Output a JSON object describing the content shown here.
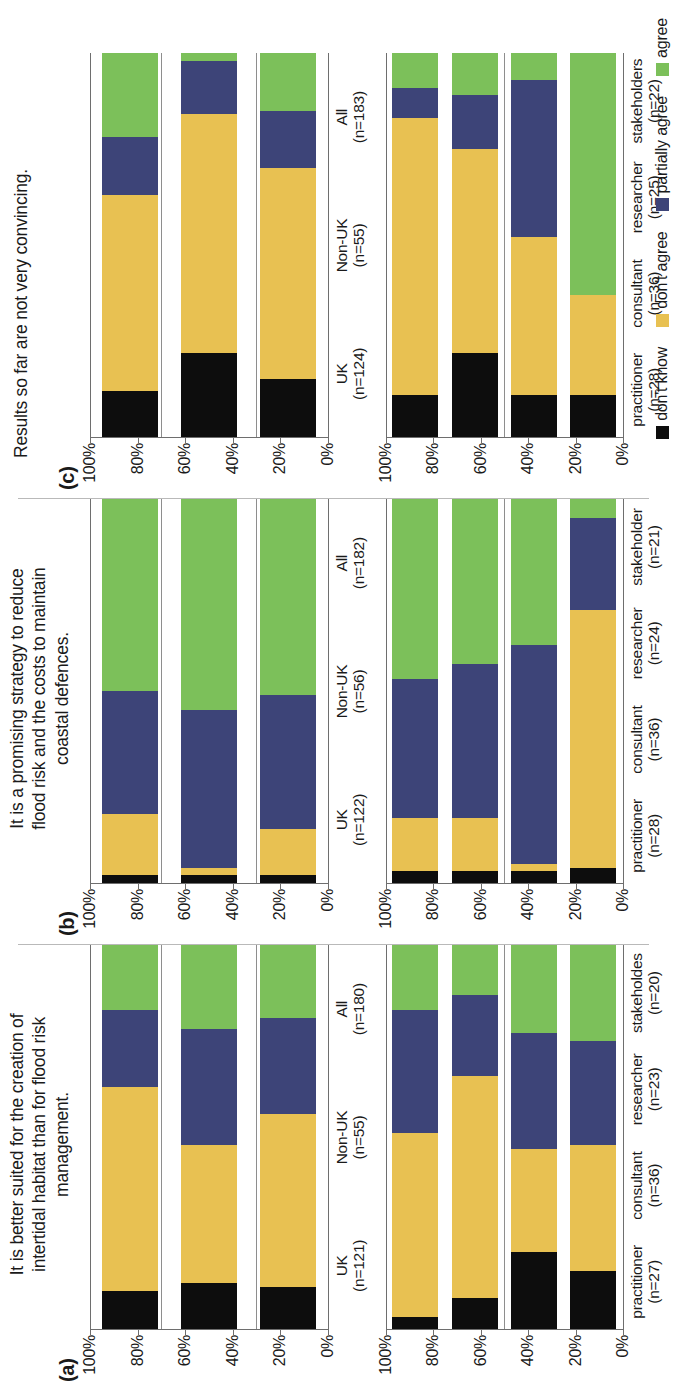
{
  "figure": {
    "legend": {
      "position": "bottom-right",
      "items": [
        {
          "label": "don't know",
          "color": "#0d0d0d"
        },
        {
          "label": "don't agree",
          "color": "#e8c152"
        },
        {
          "label": "partially agree",
          "color": "#3d4478"
        },
        {
          "label": "agree",
          "color": "#7cc05a"
        }
      ]
    },
    "axis": {
      "ticks": [
        "100%",
        "80%",
        "60%",
        "40%",
        "20%",
        "0%"
      ],
      "tick_values": [
        100,
        80,
        60,
        40,
        20,
        0
      ],
      "minor_step": 10
    },
    "panels": [
      {
        "letter": "(a)",
        "title": "It is better suited for the creation of intertidal habitat than for flood risk management.",
        "title_lines": [
          "It is better suited for the creation of",
          "intertidal habitat than for flood risk",
          "management."
        ]
      },
      {
        "letter": "(b)",
        "title": "It is a promising strategy to reduce flood risk and the costs to maintain coastal defences.",
        "title_lines": [
          "It is a promising strategy to reduce",
          "flood risk and the costs to maintain",
          "coastal defences."
        ]
      },
      {
        "letter": "(c)",
        "title": "Results so far are not very convincing.",
        "title_lines": [
          "Results so far are not very convincing."
        ]
      }
    ]
  },
  "chart_data": [
    {
      "panel": "(a)",
      "subplot": "top",
      "type": "bar",
      "orientation": "stacked-horizontal-percent",
      "title": "It is better suited for the creation of intertidal habitat than for flood risk management.",
      "xlabel": "",
      "ylabel": "",
      "ylim": [
        0,
        100
      ],
      "grid": true,
      "tick_labels": [
        "100%",
        "80%",
        "60%",
        "40%",
        "20%",
        "0%"
      ],
      "categories": [
        "UK",
        "Non-UK",
        "All"
      ],
      "category_n": [
        "(n=121)",
        "(n=55)",
        "(n=180)"
      ],
      "series": [
        {
          "name": "don't know",
          "color": "#0d0d0d",
          "values": [
            10,
            12,
            11
          ]
        },
        {
          "name": "don't agree",
          "color": "#e8c152",
          "values": [
            53,
            36,
            45
          ]
        },
        {
          "name": "partially agree",
          "color": "#3d4478",
          "values": [
            20,
            30,
            25
          ]
        },
        {
          "name": "agree",
          "color": "#7cc05a",
          "values": [
            17,
            22,
            19
          ]
        }
      ]
    },
    {
      "panel": "(a)",
      "subplot": "bottom",
      "type": "bar",
      "orientation": "stacked-horizontal-percent",
      "ylim": [
        0,
        100
      ],
      "grid": true,
      "tick_labels": [
        "100%",
        "80%",
        "60%",
        "40%",
        "20%",
        "0%"
      ],
      "categories": [
        "practitioner",
        "consultant",
        "researcher",
        "stakeholdes"
      ],
      "category_n": [
        "(n=27)",
        "(n=36)",
        "(n=23)",
        "(n=20)"
      ],
      "series": [
        {
          "name": "don't know",
          "color": "#0d0d0d",
          "values": [
            3,
            8,
            20,
            15
          ]
        },
        {
          "name": "don't agree",
          "color": "#e8c152",
          "values": [
            48,
            58,
            27,
            33
          ]
        },
        {
          "name": "partially agree",
          "color": "#3d4478",
          "values": [
            32,
            21,
            30,
            27
          ]
        },
        {
          "name": "agree",
          "color": "#7cc05a",
          "values": [
            17,
            13,
            23,
            25
          ]
        }
      ]
    },
    {
      "panel": "(b)",
      "subplot": "top",
      "type": "bar",
      "orientation": "stacked-horizontal-percent",
      "title": "It is a promising strategy to reduce flood risk and the costs to maintain coastal defences.",
      "ylim": [
        0,
        100
      ],
      "grid": true,
      "tick_labels": [
        "100%",
        "80%",
        "60%",
        "40%",
        "20%",
        "0%"
      ],
      "categories": [
        "UK",
        "Non-UK",
        "All"
      ],
      "category_n": [
        "(n=122)",
        "(n=56)",
        "(n=182)"
      ],
      "series": [
        {
          "name": "don't know",
          "color": "#0d0d0d",
          "values": [
            2,
            2,
            2
          ]
        },
        {
          "name": "don't agree",
          "color": "#e8c152",
          "values": [
            16,
            2,
            12
          ]
        },
        {
          "name": "partially agree",
          "color": "#3d4478",
          "values": [
            32,
            41,
            35
          ]
        },
        {
          "name": "agree",
          "color": "#7cc05a",
          "values": [
            50,
            55,
            51
          ]
        }
      ]
    },
    {
      "panel": "(b)",
      "subplot": "bottom",
      "type": "bar",
      "orientation": "stacked-horizontal-percent",
      "ylim": [
        0,
        100
      ],
      "grid": true,
      "tick_labels": [
        "100%",
        "80%",
        "60%",
        "40%",
        "20%",
        "0%"
      ],
      "categories": [
        "practitioner",
        "consultant",
        "researcher",
        "stakeholder"
      ],
      "category_n": [
        "(n=28)",
        "(n=36)",
        "(n=24)",
        "(n=21)"
      ],
      "series": [
        {
          "name": "don't know",
          "color": "#0d0d0d",
          "values": [
            3,
            3,
            3,
            4
          ]
        },
        {
          "name": "don't agree",
          "color": "#e8c152",
          "values": [
            14,
            14,
            2,
            67
          ]
        },
        {
          "name": "partially agree",
          "color": "#3d4478",
          "values": [
            36,
            40,
            57,
            24
          ]
        },
        {
          "name": "agree",
          "color": "#7cc05a",
          "values": [
            47,
            43,
            38,
            5
          ]
        }
      ]
    },
    {
      "panel": "(c)",
      "subplot": "top",
      "type": "bar",
      "orientation": "stacked-horizontal-percent",
      "title": "Results so far are not very convincing.",
      "ylim": [
        0,
        100
      ],
      "grid": true,
      "tick_labels": [
        "100%",
        "80%",
        "60%",
        "40%",
        "20%",
        "0%"
      ],
      "categories": [
        "UK",
        "Non-UK",
        "All"
      ],
      "category_n": [
        "(n=124)",
        "(n=55)",
        "(n=183)"
      ],
      "series": [
        {
          "name": "don't know",
          "color": "#0d0d0d",
          "values": [
            12,
            22,
            15
          ]
        },
        {
          "name": "don't agree",
          "color": "#e8c152",
          "values": [
            51,
            62,
            55
          ]
        },
        {
          "name": "partially agree",
          "color": "#3d4478",
          "values": [
            15,
            14,
            15
          ]
        },
        {
          "name": "agree",
          "color": "#7cc05a",
          "values": [
            22,
            2,
            15
          ]
        }
      ]
    },
    {
      "panel": "(c)",
      "subplot": "bottom",
      "type": "bar",
      "orientation": "stacked-horizontal-percent",
      "ylim": [
        0,
        100
      ],
      "grid": true,
      "tick_labels": [
        "100%",
        "80%",
        "60%",
        "40%",
        "20%",
        "0%"
      ],
      "categories": [
        "practitioner",
        "consultant",
        "researcher",
        "stakeholders"
      ],
      "category_n": [
        "(n=28)",
        "(n=36)",
        "(n=25)",
        "(n=22)"
      ],
      "series": [
        {
          "name": "don't know",
          "color": "#0d0d0d",
          "values": [
            11,
            22,
            11,
            11
          ]
        },
        {
          "name": "don't agree",
          "color": "#e8c152",
          "values": [
            72,
            53,
            41,
            26
          ]
        },
        {
          "name": "partially agree",
          "color": "#3d4478",
          "values": [
            8,
            14,
            41,
            0
          ]
        },
        {
          "name": "agree",
          "color": "#7cc05a",
          "values": [
            9,
            11,
            7,
            63
          ]
        }
      ]
    }
  ]
}
